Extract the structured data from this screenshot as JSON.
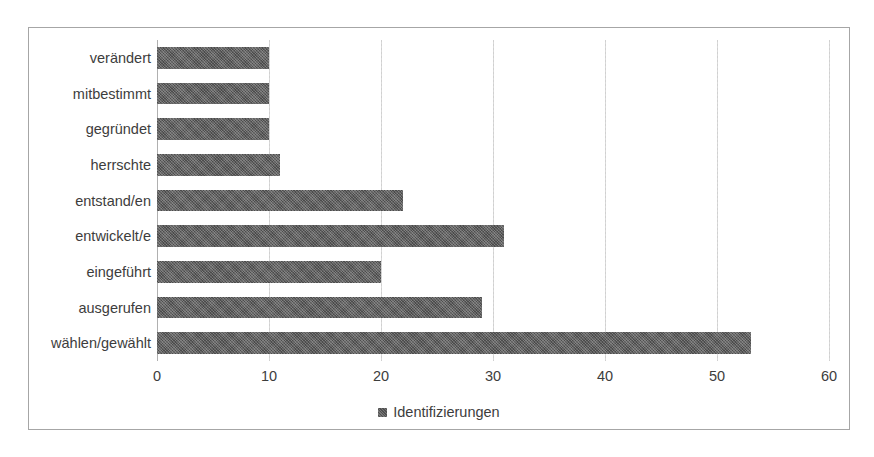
{
  "chart_data": {
    "type": "bar",
    "orientation": "horizontal",
    "title": "",
    "xlabel": "",
    "ylabel": "",
    "xlim": [
      0,
      60
    ],
    "xticks": [
      0,
      10,
      20,
      30,
      40,
      50,
      60
    ],
    "xtick_labels": [
      "0",
      "10",
      "20",
      "30",
      "40",
      "50",
      "60"
    ],
    "grid": true,
    "grid_axis": "x",
    "legend_position": "bottom",
    "categories": [
      "verändert",
      "mitbestimmt",
      "gegründet",
      "herrschte",
      "entstand/en",
      "entwickelt/e",
      "eingeführt",
      "ausgerufen",
      "wählen/gewählt"
    ],
    "series": [
      {
        "name": "Identifizierungen",
        "color": "#595959",
        "values": [
          10,
          10,
          10,
          11,
          22,
          31,
          20,
          29,
          53
        ]
      }
    ]
  },
  "legend": {
    "entries": [
      {
        "label": "Identifizierungen",
        "color": "#595959",
        "marker": "square"
      }
    ]
  },
  "frame": {
    "border_color": "#a6a6a6",
    "background": "#ffffff"
  },
  "gridlines": {
    "color": "#d0d0d0",
    "axis_color": "#b0b0b0"
  }
}
